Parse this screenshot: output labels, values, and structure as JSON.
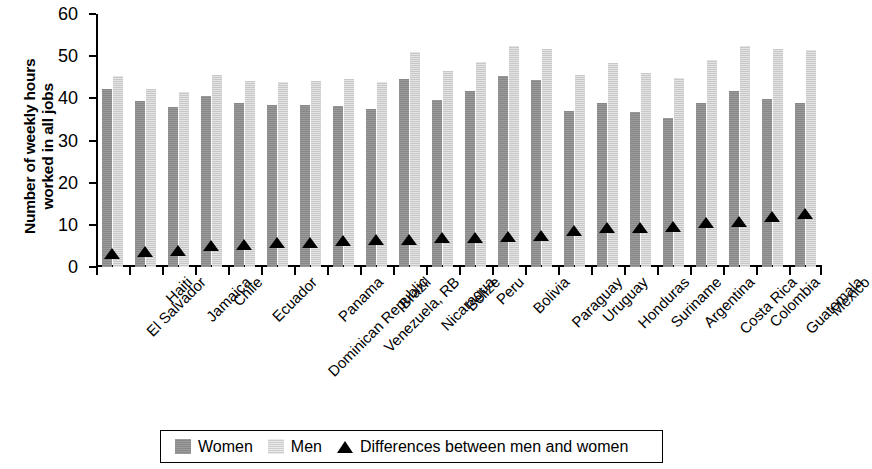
{
  "chart_data": {
    "type": "bar",
    "title": "",
    "xlabel": "",
    "ylabel": "Number of weekly hours\nworked in all jobs",
    "ylim": [
      0,
      60
    ],
    "yticks": [
      0,
      10,
      20,
      30,
      40,
      50,
      60
    ],
    "grid": false,
    "legend_position": "bottom",
    "categories": [
      "El Salvador",
      "Haiti",
      "Jamaica",
      "Chile",
      "Ecuador",
      "Dominican Republic",
      "Panama",
      "Venezuela, RB",
      "Brazil",
      "Nicaragua",
      "Belize",
      "Peru",
      "Bolivia",
      "Paraguay",
      "Uruguay",
      "Honduras",
      "Suriname",
      "Argentina",
      "Costa Rica",
      "Colombia",
      "Guatemala",
      "Mexico"
    ],
    "series": [
      {
        "name": "Women",
        "color": "#8f8f8f",
        "values": [
          42.2,
          39.3,
          38.0,
          40.6,
          38.9,
          38.4,
          38.5,
          38.2,
          37.5,
          44.6,
          39.7,
          41.8,
          45.3,
          44.4,
          37.1,
          39.0,
          36.7,
          35.4,
          38.8,
          41.8,
          39.8,
          38.8
        ]
      },
      {
        "name": "Men",
        "color": "#d6d6d6",
        "values": [
          45.4,
          42.3,
          41.4,
          45.5,
          44.1,
          43.9,
          44.2,
          44.5,
          43.9,
          50.9,
          46.6,
          48.6,
          52.3,
          51.6,
          45.6,
          48.3,
          45.9,
          44.9,
          49.2,
          52.4,
          51.6,
          51.4
        ]
      }
    ],
    "markers": {
      "name": "Differences between men and women",
      "color": "#000000",
      "shape": "triangle",
      "values": [
        3.2,
        3.6,
        3.8,
        4.9,
        5.3,
        5.6,
        5.8,
        6.2,
        6.4,
        6.4,
        6.9,
        6.9,
        7.0,
        7.3,
        8.6,
        9.3,
        9.3,
        9.6,
        10.4,
        10.6,
        11.8,
        12.6
      ]
    }
  },
  "legend": {
    "entries": [
      {
        "label": "Women",
        "icon": "filled-square-dark-gray"
      },
      {
        "label": "Men",
        "icon": "filled-square-light-gray"
      },
      {
        "label": "Differences between men and women",
        "icon": "filled-triangle-black"
      }
    ]
  }
}
